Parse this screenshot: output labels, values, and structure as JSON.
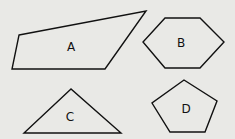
{
  "diagram": {
    "background": "#e9e9e6",
    "stroke": "#111111",
    "shapes": [
      {
        "id": "A",
        "type": "quadrilateral",
        "label": "A",
        "points": "19,35 146,11 105,69 12,69",
        "label_pos": [
          71,
          51
        ]
      },
      {
        "id": "B",
        "type": "hexagon",
        "label": "B",
        "points": "165,18 200,18 224,42 200,68 165,68 143,42",
        "label_pos": [
          181,
          47
        ]
      },
      {
        "id": "C",
        "type": "triangle",
        "label": "C",
        "points": "71,89 24,133 121,133",
        "label_pos": [
          70,
          121
        ]
      },
      {
        "id": "D",
        "type": "pentagon",
        "label": "D",
        "points": "184,80 217,101 205,132 170,132 152,103",
        "label_pos": [
          186,
          113
        ]
      }
    ]
  }
}
